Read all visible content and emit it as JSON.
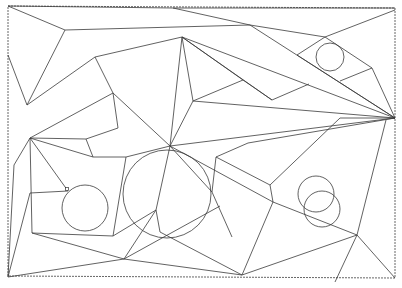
{
  "diagram": {
    "title": "",
    "width": 402,
    "height": 288,
    "stroke_color": "#3a3a3a",
    "background": "#ffffff",
    "frame": {
      "points": [
        [
          8,
          6
        ],
        [
          395,
          8
        ],
        [
          395,
          278
        ],
        [
          8,
          276
        ]
      ],
      "style": "dashed"
    },
    "segments": [
      [
        [
          8,
          6
        ],
        [
          65,
          30
        ]
      ],
      [
        [
          8,
          6
        ],
        [
          173,
          8
        ]
      ],
      [
        [
          173,
          8
        ],
        [
          250,
          25
        ]
      ],
      [
        [
          173,
          8
        ],
        [
          395,
          8
        ]
      ],
      [
        [
          65,
          30
        ],
        [
          250,
          25
        ]
      ],
      [
        [
          250,
          25
        ],
        [
          395,
          118
        ]
      ],
      [
        [
          250,
          25
        ],
        [
          325,
          37
        ]
      ],
      [
        [
          325,
          37
        ],
        [
          395,
          10
        ]
      ],
      [
        [
          325,
          37
        ],
        [
          372,
          68
        ]
      ],
      [
        [
          372,
          68
        ],
        [
          395,
          118
        ]
      ],
      [
        [
          297,
          55
        ],
        [
          325,
          37
        ]
      ],
      [
        [
          297,
          55
        ],
        [
          395,
          118
        ]
      ],
      [
        [
          340,
          81
        ],
        [
          372,
          68
        ]
      ],
      [
        [
          65,
          30
        ],
        [
          27,
          105
        ]
      ],
      [
        [
          8,
          55
        ],
        [
          27,
          105
        ]
      ],
      [
        [
          182,
          37
        ],
        [
          95,
          57
        ]
      ],
      [
        [
          95,
          57
        ],
        [
          27,
          105
        ]
      ],
      [
        [
          95,
          57
        ],
        [
          113,
          93
        ]
      ],
      [
        [
          113,
          93
        ],
        [
          30,
          138
        ]
      ],
      [
        [
          113,
          93
        ],
        [
          118,
          128
        ]
      ],
      [
        [
          118,
          128
        ],
        [
          86,
          139
        ]
      ],
      [
        [
          86,
          139
        ],
        [
          93,
          157
        ]
      ],
      [
        [
          30,
          138
        ],
        [
          86,
          139
        ]
      ],
      [
        [
          30,
          138
        ],
        [
          93,
          157
        ]
      ],
      [
        [
          93,
          157
        ],
        [
          126,
          157
        ]
      ],
      [
        [
          126,
          157
        ],
        [
          170,
          146
        ]
      ],
      [
        [
          182,
          37
        ],
        [
          170,
          146
        ]
      ],
      [
        [
          182,
          37
        ],
        [
          193,
          101
        ]
      ],
      [
        [
          182,
          37
        ],
        [
          272,
          100
        ]
      ],
      [
        [
          182,
          37
        ],
        [
          395,
          118
        ]
      ],
      [
        [
          182,
          37
        ],
        [
          243,
          80
        ]
      ],
      [
        [
          243,
          80
        ],
        [
          272,
          100
        ]
      ],
      [
        [
          272,
          100
        ],
        [
          309,
          84
        ]
      ],
      [
        [
          193,
          101
        ],
        [
          243,
          80
        ]
      ],
      [
        [
          193,
          101
        ],
        [
          170,
          146
        ]
      ],
      [
        [
          113,
          93
        ],
        [
          170,
          146
        ]
      ],
      [
        [
          193,
          101
        ],
        [
          395,
          118
        ]
      ],
      [
        [
          170,
          146
        ],
        [
          395,
          118
        ]
      ],
      [
        [
          30,
          138
        ],
        [
          14,
          165
        ]
      ],
      [
        [
          14,
          165
        ],
        [
          8,
          277
        ]
      ],
      [
        [
          30,
          138
        ],
        [
          68,
          191
        ]
      ],
      [
        [
          30,
          138
        ],
        [
          32,
          233
        ]
      ],
      [
        [
          30,
          193
        ],
        [
          68,
          191
        ]
      ],
      [
        [
          32,
          233
        ],
        [
          113,
          236
        ]
      ],
      [
        [
          32,
          233
        ],
        [
          124,
          259
        ]
      ],
      [
        [
          8,
          277
        ],
        [
          30,
          193
        ]
      ],
      [
        [
          8,
          277
        ],
        [
          124,
          259
        ]
      ],
      [
        [
          113,
          236
        ],
        [
          126,
          157
        ]
      ],
      [
        [
          113,
          236
        ],
        [
          156,
          210
        ]
      ],
      [
        [
          124,
          259
        ],
        [
          156,
          210
        ]
      ],
      [
        [
          124,
          259
        ],
        [
          242,
          275
        ]
      ],
      [
        [
          124,
          259
        ],
        [
          220,
          206
        ]
      ],
      [
        [
          156,
          210
        ],
        [
          160,
          232
        ]
      ],
      [
        [
          156,
          210
        ],
        [
          170,
          146
        ]
      ],
      [
        [
          160,
          232
        ],
        [
          242,
          275
        ]
      ],
      [
        [
          170,
          146
        ],
        [
          273,
          202
        ]
      ],
      [
        [
          170,
          146
        ],
        [
          212,
          192
        ]
      ],
      [
        [
          212,
          192
        ],
        [
          216,
          157
        ]
      ],
      [
        [
          216,
          157
        ],
        [
          248,
          143
        ]
      ],
      [
        [
          248,
          143
        ],
        [
          395,
          118
        ]
      ],
      [
        [
          216,
          157
        ],
        [
          270,
          185
        ]
      ],
      [
        [
          270,
          185
        ],
        [
          273,
          202
        ]
      ],
      [
        [
          270,
          185
        ],
        [
          340,
          118
        ]
      ],
      [
        [
          340,
          118
        ],
        [
          395,
          118
        ]
      ],
      [
        [
          273,
          202
        ],
        [
          357,
          235
        ]
      ],
      [
        [
          242,
          275
        ],
        [
          273,
          202
        ]
      ],
      [
        [
          242,
          275
        ],
        [
          357,
          235
        ]
      ],
      [
        [
          357,
          235
        ],
        [
          386,
          120
        ]
      ],
      [
        [
          357,
          235
        ],
        [
          335,
          282
        ]
      ],
      [
        [
          357,
          235
        ],
        [
          395,
          278
        ]
      ],
      [
        [
          212,
          192
        ],
        [
          232,
          237
        ]
      ]
    ],
    "circles": [
      {
        "cx": 330,
        "cy": 57,
        "r": 14
      },
      {
        "cx": 85,
        "cy": 208,
        "r": 23
      },
      {
        "cx": 167,
        "cy": 194,
        "r": 44
      },
      {
        "cx": 316,
        "cy": 194,
        "r": 18
      },
      {
        "cx": 322,
        "cy": 209,
        "r": 18
      }
    ],
    "markers": [
      {
        "x": 67,
        "y": 189,
        "size": 3
      }
    ]
  }
}
